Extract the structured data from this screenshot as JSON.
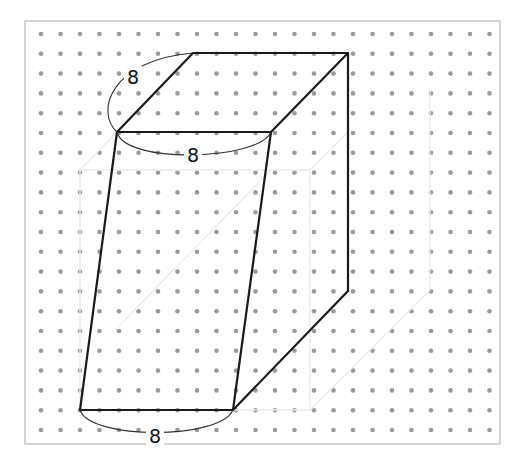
{
  "diagram": {
    "type": "isometric-dot-grid-prism",
    "frame": {
      "x": 25,
      "y": 21,
      "width": 475,
      "height": 423
    },
    "grid": {
      "origin_x": 41,
      "origin_y": 34,
      "spacing_x": 19.5,
      "spacing_y": 19.8,
      "cols": 24,
      "rows": 21,
      "dot_color": "#9a9a9a"
    },
    "vertices": {
      "top_back_left": [
        193,
        53
      ],
      "top_back_right": [
        348,
        53
      ],
      "top_front_left": [
        117,
        132
      ],
      "top_front_right": [
        271,
        132
      ],
      "bottom_back_right": [
        348,
        291
      ],
      "bottom_front_left": [
        80,
        410
      ],
      "bottom_front_right": [
        233,
        410
      ]
    },
    "labels": [
      {
        "id": "depth",
        "text": "8",
        "x": 133,
        "y": 77
      },
      {
        "id": "top-width",
        "text": "8",
        "x": 193,
        "y": 155
      },
      {
        "id": "bottom-width",
        "text": "8",
        "x": 155,
        "y": 436
      }
    ],
    "colors": {
      "edge": "#1a1a1a",
      "dot": "#9a9a9a",
      "frame": "#b8b8b8",
      "ghost_lines": "#ececec"
    }
  }
}
